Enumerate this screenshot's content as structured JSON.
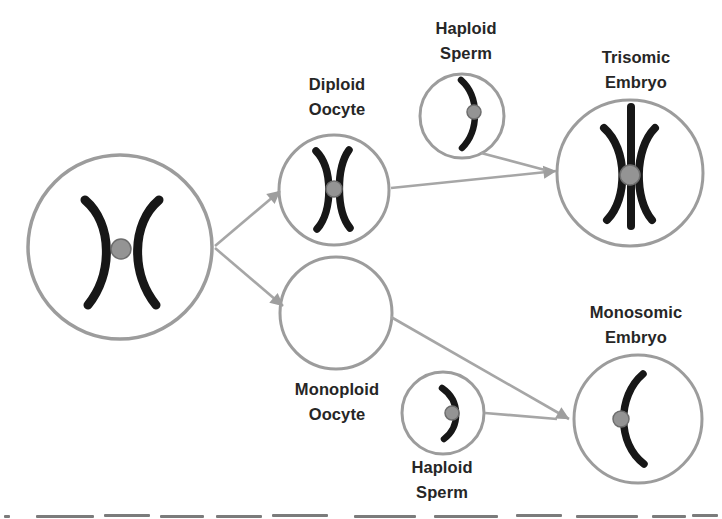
{
  "figure": {
    "labels": {
      "diploid_oocyte": [
        "Diploid",
        "Oocyte"
      ],
      "haploid_sperm_top": [
        "Haploid",
        "Sperm"
      ],
      "trisomic_embryo": [
        "Trisomic",
        "Embryo"
      ],
      "monoploid_oocyte": [
        "Monoploid",
        "Oocyte"
      ],
      "haploid_sperm_bottom": [
        "Haploid",
        "Sperm"
      ],
      "monosomic_embryo": [
        "Monosomic",
        "Embryo"
      ]
    },
    "nodes": [
      {
        "id": "parent-cell",
        "label": "",
        "contents": "duplicated chromosome (two crossed chromatids with centromere)"
      },
      {
        "id": "diploid-oocyte",
        "label": "Diploid Oocyte",
        "contents": "duplicated chromosome (two crossed chromatids with centromere)"
      },
      {
        "id": "haploid-sperm-top",
        "label": "Haploid Sperm",
        "contents": "single curved chromatid with centromere"
      },
      {
        "id": "trisomic-embryo",
        "label": "Trisomic Embryo",
        "contents": "three chromatids (two curved plus one straight) with centromere"
      },
      {
        "id": "monoploid-oocyte",
        "label": "Monoploid Oocyte",
        "contents": "empty cell (no chromosome)"
      },
      {
        "id": "haploid-sperm-bottom",
        "label": "Haploid Sperm",
        "contents": "single curved chromatid with centromere"
      },
      {
        "id": "monosomic-embryo",
        "label": "Monosomic Embryo",
        "contents": "single curved chromatid with centromere"
      }
    ],
    "arrows": [
      {
        "from": "parent-cell",
        "to": "diploid-oocyte"
      },
      {
        "from": "parent-cell",
        "to": "monoploid-oocyte"
      },
      {
        "from": "diploid-oocyte",
        "to": "trisomic-embryo"
      },
      {
        "from": "haploid-sperm-top",
        "to": "trisomic-embryo"
      },
      {
        "from": "monoploid-oocyte",
        "to": "monosomic-embryo"
      },
      {
        "from": "haploid-sperm-bottom",
        "to": "monosomic-embryo"
      }
    ],
    "colors": {
      "background": "#ffffff",
      "cell_border": "#9c9c9c",
      "chromosome": "#171717",
      "centromere_fill": "#949494",
      "centromere_edge": "#6d6d6d",
      "arrow": "#a6a6a6",
      "label_text": "#262626"
    },
    "notes": {
      "bottom_caption": "caption line cropped at image bottom edge (only letter tops visible, illegible)"
    }
  }
}
